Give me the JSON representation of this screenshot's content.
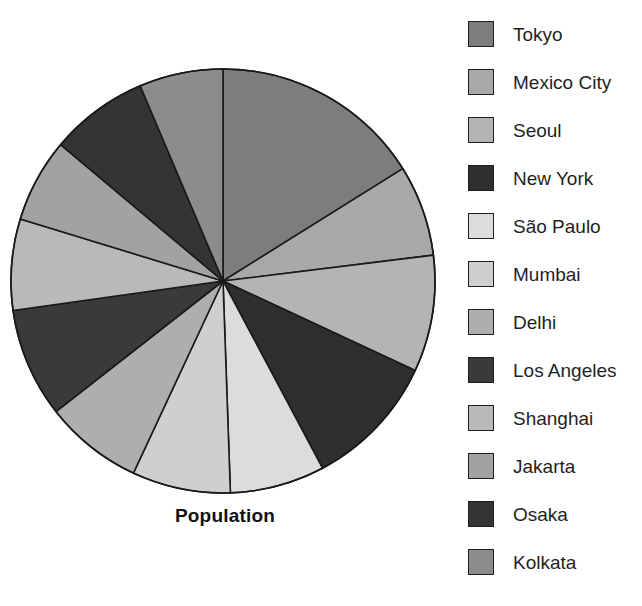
{
  "chart_data": {
    "type": "pie",
    "title": "Population",
    "xlabel": "",
    "ylabel": "",
    "legend_position": "right",
    "grid": false,
    "start_angle_deg": 0,
    "direction": "clockwise",
    "categories": [
      "Tokyo",
      "Mexico City",
      "Seoul",
      "New York",
      "São Paulo",
      "Mumbai",
      "Delhi",
      "Los Angeles",
      "Shanghai",
      "Jakarta",
      "Osaka",
      "Kolkata"
    ],
    "values": [
      16.1,
      7.0,
      8.9,
      10.3,
      7.2,
      7.5,
      7.5,
      8.3,
      7.0,
      6.4,
      7.5,
      6.3
    ],
    "slices": [
      {
        "label": "Tokyo",
        "value": 16.1,
        "color": "#7d7d7d",
        "start_deg": 0,
        "end_deg": 58
      },
      {
        "label": "Mexico City",
        "value": 7.0,
        "color": "#a8a8a8",
        "start_deg": 58,
        "end_deg": 83
      },
      {
        "label": "Seoul",
        "value": 8.9,
        "color": "#b4b4b4",
        "start_deg": 83,
        "end_deg": 115
      },
      {
        "label": "New York",
        "value": 10.3,
        "color": "#2f2f2f",
        "start_deg": 115,
        "end_deg": 152
      },
      {
        "label": "São Paulo",
        "value": 7.2,
        "color": "#dcdcdc",
        "start_deg": 152,
        "end_deg": 178
      },
      {
        "label": "Mumbai",
        "value": 7.5,
        "color": "#cfcfcf",
        "start_deg": 178,
        "end_deg": 205
      },
      {
        "label": "Delhi",
        "value": 7.5,
        "color": "#aeaeae",
        "start_deg": 205,
        "end_deg": 232
      },
      {
        "label": "Los Angeles",
        "value": 8.3,
        "color": "#3a3a3a",
        "start_deg": 232,
        "end_deg": 262
      },
      {
        "label": "Shanghai",
        "value": 7.0,
        "color": "#b9b9b9",
        "start_deg": 262,
        "end_deg": 287
      },
      {
        "label": "Jakarta",
        "value": 6.4,
        "color": "#a2a2a2",
        "start_deg": 287,
        "end_deg": 310
      },
      {
        "label": "Osaka",
        "value": 7.5,
        "color": "#343434",
        "start_deg": 310,
        "end_deg": 337
      },
      {
        "label": "Kolkata",
        "value": 6.3,
        "color": "#8c8c8c",
        "start_deg": 337,
        "end_deg": 360
      }
    ],
    "geometry": {
      "cx": 223,
      "cy": 281,
      "r": 212,
      "stroke": "#1a1a1a",
      "stroke_width": 1.6
    }
  },
  "legend": {
    "items": [
      {
        "label": "Tokyo",
        "color": "#7d7d7d"
      },
      {
        "label": "Mexico City",
        "color": "#a8a8a8"
      },
      {
        "label": "Seoul",
        "color": "#b4b4b4"
      },
      {
        "label": "New York",
        "color": "#2f2f2f"
      },
      {
        "label": "São Paulo",
        "color": "#dcdcdc"
      },
      {
        "label": "Mumbai",
        "color": "#cfcfcf"
      },
      {
        "label": "Delhi",
        "color": "#aeaeae"
      },
      {
        "label": "Los Angeles",
        "color": "#3a3a3a"
      },
      {
        "label": "Shanghai",
        "color": "#b9b9b9"
      },
      {
        "label": "Jakarta",
        "color": "#a2a2a2"
      },
      {
        "label": "Osaka",
        "color": "#343434"
      },
      {
        "label": "Kolkata",
        "color": "#8c8c8c"
      }
    ]
  }
}
